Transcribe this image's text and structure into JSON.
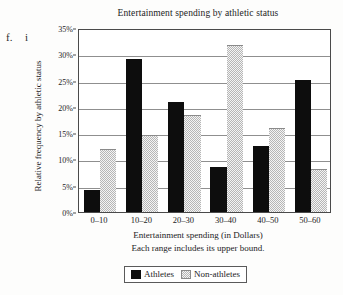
{
  "markers": {
    "outer": "f.",
    "inner": "i"
  },
  "legend": {
    "athletes_label": "Athletes",
    "nonathletes_label": "Non-athletes",
    "athletes_color": "#0d0d0d",
    "nonathletes_color": "#b6b6b6"
  },
  "chart_data": {
    "type": "bar",
    "title": "Entertainment spending by athletic status",
    "xlabel": "Entertainment spending (in Dollars)",
    "xnote": "Each range includes its upper bound.",
    "ylabel": "Relative frequency by athletic status",
    "categories": [
      "0–10",
      "10–20",
      "20–30",
      "30–40",
      "40–50",
      "50–60"
    ],
    "series": [
      {
        "name": "Athletes",
        "values": [
          4.2,
          29.2,
          20.9,
          8.5,
          12.6,
          25.1
        ]
      },
      {
        "name": "Non-athletes",
        "values": [
          11.9,
          14.6,
          18.5,
          31.7,
          15.9,
          8.1
        ]
      }
    ],
    "ylim": [
      0,
      35
    ],
    "ytick_values": [
      0,
      5,
      10,
      15,
      20,
      25,
      30,
      35
    ],
    "ytick_labels": [
      "0%",
      "5%",
      "10%",
      "15%",
      "20%",
      "25%",
      "30%",
      "35%"
    ],
    "grid": true,
    "legend_position": "bottom"
  }
}
